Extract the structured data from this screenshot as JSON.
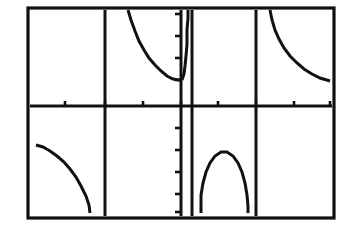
{
  "app": {
    "title": "Graphing Calculator Screen",
    "description": "Graphing calculator viewing window showing a periodic rational/trigonometric function with three vertical asymptotes"
  },
  "colors": {
    "background": "#ffffff",
    "ink": "#111111",
    "border": "#111111"
  },
  "screen": {
    "frame": {
      "x": 28,
      "y": 8,
      "width": 306,
      "height": 210
    },
    "border_width": 3.2
  },
  "chart_data": {
    "type": "line",
    "title": "",
    "subtitle": "",
    "xlabel": "",
    "ylabel": "",
    "grid": false,
    "legend": null,
    "legend_position": "none",
    "axes": {
      "x_axis": {
        "pixel_y": 106,
        "x_start": 30,
        "x_end": 332,
        "visible": true
      },
      "y_axis": {
        "pixel_x": 181,
        "y_start": 10,
        "y_end": 216,
        "visible": true
      },
      "xlim": [
        -4,
        4
      ],
      "ylim": [
        -3,
        3
      ],
      "x_tick_interval": 1,
      "y_tick_interval": 1
    },
    "x_ticks": [
      {
        "label": "",
        "pixel_x": 65
      },
      {
        "label": "",
        "pixel_x": 105
      },
      {
        "label": "",
        "pixel_x": 143
      },
      {
        "label": "",
        "pixel_x": 181
      },
      {
        "label": "",
        "pixel_x": 218
      },
      {
        "label": "",
        "pixel_x": 256
      },
      {
        "label": "",
        "pixel_x": 294
      },
      {
        "label": "",
        "pixel_x": 330
      }
    ],
    "y_ticks": [
      {
        "label": "",
        "pixel_y": 14
      },
      {
        "label": "",
        "pixel_y": 36
      },
      {
        "label": "",
        "pixel_y": 58
      },
      {
        "label": "",
        "pixel_y": 80
      },
      {
        "label": "",
        "pixel_y": 128
      },
      {
        "label": "",
        "pixel_y": 150
      },
      {
        "label": "",
        "pixel_y": 172
      },
      {
        "label": "",
        "pixel_y": 194
      },
      {
        "label": "",
        "pixel_y": 212
      }
    ],
    "asymptotes": [
      {
        "name": "asymptote-left",
        "pixel_x": 105,
        "y_start": 10,
        "y_end": 216
      },
      {
        "name": "asymptote-center",
        "pixel_x": 192,
        "y_start": 10,
        "y_end": 216
      },
      {
        "name": "asymptote-right",
        "pixel_x": 256,
        "y_start": 10,
        "y_end": 216
      }
    ],
    "branches": [
      {
        "name": "branch-upper-left",
        "points": "128,10 131,20 135,31 139,41 144,50 149,58 155,65 161,71 167,76 173,79 179,80 182,80"
      },
      {
        "name": "branch-upper-spike",
        "points": "182,80 184,74 185,66 186,56 187,44 187,30 188,18 188,10"
      },
      {
        "name": "branch-upper-right",
        "points": "270,10 272,20 275,30 279,39 284,48 290,56 297,63 304,69 312,74 320,78 330,81"
      },
      {
        "name": "branch-lower-left",
        "points": "36,145 43,147 50,151 57,156 64,162 70,169 76,177 81,186 86,196 89,205 90,213"
      },
      {
        "name": "branch-lower-arch",
        "points": "201,213 201,195 203,183 206,172 210,163 215,156 221,152 227,152 233,156 238,163 242,172 245,183 247,195 248,206 248,213"
      }
    ]
  }
}
